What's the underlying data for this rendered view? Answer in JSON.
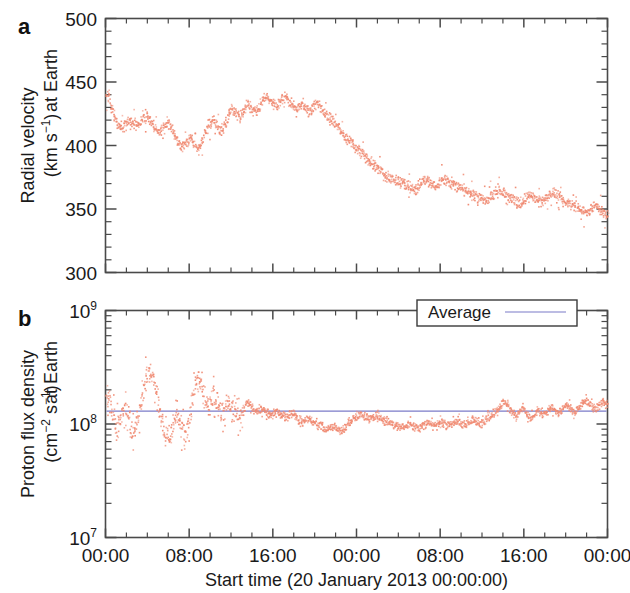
{
  "figure": {
    "panels": [
      {
        "letter": "a",
        "ylabel_line1": "Radial velocity",
        "ylabel_line2_pre": "(km s",
        "ylabel_line2_sup": "−1",
        "ylabel_line2_post": ")",
        "ylabel_suffix": "at Earth"
      },
      {
        "letter": "b",
        "ylabel_line1": "Proton flux density",
        "ylabel_line2_pre": "(cm",
        "ylabel_line2_sup1": "−2",
        "ylabel_line2_mid": " s",
        "ylabel_line2_sup2": "−1",
        "ylabel_line2_post": ")",
        "ylabel_suffix": "at Earth"
      }
    ],
    "legend": {
      "label": "Average",
      "line_color": "#7b7bc8"
    },
    "xaxis": {
      "title": "Start time (20 January 2013 00:00:00)",
      "ticklabels": [
        "00:00",
        "08:00",
        "16:00",
        "00:00",
        "08:00",
        "16:00",
        "00:00"
      ],
      "tick_hours": [
        0,
        8,
        16,
        24,
        32,
        40,
        48
      ],
      "range_hours": [
        0,
        48
      ]
    },
    "series_color": "#f08a72",
    "axis_color": "#4a4a4a"
  },
  "chart_data": [
    {
      "type": "scatter",
      "panel": "a",
      "title": "",
      "xlabel": "Start time (20 January 2013 00:00:00)",
      "ylabel": "Radial velocity at Earth (km s−1)",
      "xlim": [
        0,
        48
      ],
      "ylim": [
        300,
        500
      ],
      "yticks": [
        300,
        350,
        400,
        450,
        500
      ],
      "xticks": [
        0,
        8,
        16,
        24,
        32,
        40,
        48
      ],
      "xticklabels": [
        "00:00",
        "08:00",
        "16:00",
        "00:00",
        "08:00",
        "16:00",
        "00:00"
      ],
      "yscale": "linear",
      "grid": false,
      "marker_color": "#f08a72",
      "x": [
        0.0,
        0.25,
        0.5,
        0.75,
        1.0,
        1.25,
        1.5,
        1.75,
        2.0,
        2.25,
        2.5,
        2.75,
        3.0,
        3.25,
        3.5,
        3.75,
        4.0,
        4.25,
        4.5,
        4.75,
        5.0,
        5.25,
        5.5,
        5.75,
        6.0,
        6.25,
        6.5,
        6.75,
        7.0,
        7.25,
        7.5,
        7.75,
        8.0,
        8.25,
        8.5,
        8.75,
        9.0,
        9.25,
        9.5,
        9.75,
        10.0,
        10.25,
        10.5,
        10.75,
        11.0,
        11.25,
        11.5,
        11.75,
        12.0,
        12.25,
        12.5,
        12.75,
        13.0,
        13.25,
        13.5,
        13.75,
        14.0,
        14.25,
        14.5,
        14.75,
        15.0,
        15.25,
        15.5,
        15.75,
        16.0,
        16.25,
        16.5,
        16.75,
        17.0,
        17.25,
        17.5,
        17.75,
        18.0,
        18.25,
        18.5,
        18.75,
        19.0,
        19.25,
        19.5,
        19.75,
        20.0,
        20.25,
        20.5,
        20.75,
        21.0,
        21.25,
        21.5,
        21.75,
        22.0,
        22.25,
        22.5,
        22.75,
        23.0,
        23.25,
        23.5,
        23.75,
        24.0,
        24.25,
        24.5,
        24.75,
        25.0,
        25.25,
        25.5,
        25.75,
        26.0,
        26.25,
        26.5,
        26.75,
        27.0,
        27.25,
        27.5,
        27.75,
        28.0,
        28.25,
        28.5,
        28.75,
        29.0,
        29.25,
        29.5,
        29.75,
        30.0,
        30.25,
        30.5,
        30.75,
        31.0,
        31.25,
        31.5,
        31.75,
        32.0,
        32.25,
        32.5,
        32.75,
        33.0,
        33.25,
        33.5,
        33.75,
        34.0,
        34.25,
        34.5,
        34.75,
        35.0,
        35.25,
        35.5,
        35.75,
        36.0,
        36.25,
        36.5,
        36.75,
        37.0,
        37.25,
        37.5,
        37.75,
        38.0,
        38.25,
        38.5,
        38.75,
        39.0,
        39.25,
        39.5,
        39.75,
        40.0,
        40.25,
        40.5,
        40.75,
        41.0,
        41.25,
        41.5,
        41.75,
        42.0,
        42.25,
        42.5,
        42.75,
        43.0,
        43.25,
        43.5,
        43.75,
        44.0,
        44.25,
        44.5,
        44.75,
        45.0,
        45.25,
        45.5,
        45.75,
        46.0,
        46.25,
        46.5,
        46.75,
        47.0,
        47.25,
        47.5,
        47.75,
        48.0
      ],
      "y": [
        443,
        438,
        430,
        424,
        419,
        416,
        414,
        416,
        419,
        421,
        420,
        418,
        417,
        419,
        422,
        424,
        423,
        420,
        417,
        414,
        412,
        413,
        416,
        419,
        418,
        414,
        409,
        404,
        401,
        399,
        400,
        403,
        406,
        404,
        400,
        398,
        401,
        406,
        411,
        416,
        419,
        421,
        418,
        414,
        412,
        415,
        420,
        426,
        429,
        427,
        424,
        423,
        426,
        430,
        433,
        431,
        428,
        427,
        429,
        433,
        437,
        439,
        438,
        436,
        434,
        433,
        434,
        437,
        439,
        438,
        435,
        432,
        430,
        429,
        430,
        432,
        431,
        428,
        426,
        429,
        433,
        434,
        431,
        427,
        424,
        422,
        421,
        419,
        417,
        414,
        411,
        408,
        406,
        404,
        402,
        400,
        398,
        396,
        394,
        392,
        390,
        388,
        386,
        384,
        382,
        380,
        378,
        377,
        376,
        375,
        374,
        373,
        372,
        371,
        370,
        369,
        368,
        367,
        366,
        367,
        369,
        372,
        374,
        373,
        371,
        369,
        368,
        370,
        373,
        375,
        374,
        372,
        370,
        369,
        368,
        367,
        366,
        365,
        364,
        363,
        362,
        361,
        360,
        359,
        358,
        357,
        358,
        360,
        362,
        364,
        366,
        365,
        363,
        361,
        359,
        358,
        357,
        356,
        355,
        356,
        358,
        360,
        361,
        360,
        358,
        357,
        356,
        357,
        359,
        361,
        363,
        364,
        363,
        361,
        359,
        357,
        356,
        355,
        354,
        353,
        352,
        351,
        350,
        349,
        348,
        349,
        351,
        353,
        352,
        350,
        348,
        347,
        346,
        345,
        344,
        343,
        342,
        341,
        340,
        339,
        340,
        341,
        340,
        339
      ]
    },
    {
      "type": "scatter",
      "panel": "b",
      "title": "",
      "xlabel": "Start time (20 January 2013 00:00:00)",
      "ylabel": "Proton flux density at Earth (cm−2 s−1)",
      "xlim": [
        0,
        48
      ],
      "ylim": [
        10000000,
        1000000000
      ],
      "yticks": [
        10000000,
        100000000,
        1000000000
      ],
      "yticklabels": [
        "10^7",
        "10^8",
        "10^9"
      ],
      "xticks": [
        0,
        8,
        16,
        24,
        32,
        40,
        48
      ],
      "xticklabels": [
        "00:00",
        "08:00",
        "16:00",
        "00:00",
        "08:00",
        "16:00",
        "00:00"
      ],
      "yscale": "log",
      "grid": false,
      "marker_color": "#f08a72",
      "average_value": 130000000,
      "average_color": "#7b7bc8",
      "x": [
        0.0,
        0.25,
        0.5,
        0.75,
        1.0,
        1.25,
        1.5,
        1.75,
        2.0,
        2.25,
        2.5,
        2.75,
        3.0,
        3.25,
        3.5,
        3.75,
        4.0,
        4.25,
        4.5,
        4.75,
        5.0,
        5.25,
        5.5,
        5.75,
        6.0,
        6.25,
        6.5,
        6.75,
        7.0,
        7.25,
        7.5,
        7.75,
        8.0,
        8.25,
        8.5,
        8.75,
        9.0,
        9.25,
        9.5,
        9.75,
        10.0,
        10.25,
        10.5,
        10.75,
        11.0,
        11.25,
        11.5,
        11.75,
        12.0,
        12.25,
        12.5,
        12.75,
        13.0,
        13.25,
        13.5,
        13.75,
        14.0,
        14.25,
        14.5,
        14.75,
        15.0,
        15.25,
        15.5,
        15.75,
        16.0,
        16.25,
        16.5,
        16.75,
        17.0,
        17.25,
        17.5,
        17.75,
        18.0,
        18.25,
        18.5,
        18.75,
        19.0,
        19.25,
        19.5,
        19.75,
        20.0,
        20.25,
        20.5,
        20.75,
        21.0,
        21.25,
        21.5,
        21.75,
        22.0,
        22.25,
        22.5,
        22.75,
        23.0,
        23.25,
        23.5,
        23.75,
        24.0,
        24.25,
        24.5,
        24.75,
        25.0,
        25.25,
        25.5,
        25.75,
        26.0,
        26.25,
        26.5,
        26.75,
        27.0,
        27.25,
        27.5,
        27.75,
        28.0,
        28.25,
        28.5,
        28.75,
        29.0,
        29.25,
        29.5,
        29.75,
        30.0,
        30.25,
        30.5,
        30.75,
        31.0,
        31.25,
        31.5,
        31.75,
        32.0,
        32.25,
        32.5,
        32.75,
        33.0,
        33.25,
        33.5,
        33.75,
        34.0,
        34.25,
        34.5,
        34.75,
        35.0,
        35.25,
        35.5,
        35.75,
        36.0,
        36.25,
        36.5,
        36.75,
        37.0,
        37.25,
        37.5,
        37.75,
        38.0,
        38.25,
        38.5,
        38.75,
        39.0,
        39.25,
        39.5,
        39.75,
        40.0,
        40.25,
        40.5,
        40.75,
        41.0,
        41.25,
        41.5,
        41.75,
        42.0,
        42.25,
        42.5,
        42.75,
        43.0,
        43.25,
        43.5,
        43.75,
        44.0,
        44.25,
        44.5,
        44.75,
        45.0,
        45.25,
        45.5,
        45.75,
        46.0,
        46.25,
        46.5,
        46.75,
        47.0,
        47.25,
        47.5,
        47.75,
        48.0
      ],
      "y": [
        200000000.0,
        170000000.0,
        140000000.0,
        110000000.0,
        95000000.0,
        100000000.0,
        120000000.0,
        150000000.0,
        130000000.0,
        100000000.0,
        85000000.0,
        90000000.0,
        110000000.0,
        140000000.0,
        180000000.0,
        240000000.0,
        290000000.0,
        310000000.0,
        260000000.0,
        200000000.0,
        150000000.0,
        110000000.0,
        90000000.0,
        80000000.0,
        75000000.0,
        85000000.0,
        100000000.0,
        130000000.0,
        110000000.0,
        90000000.0,
        80000000.0,
        95000000.0,
        120000000.0,
        160000000.0,
        220000000.0,
        260000000.0,
        230000000.0,
        190000000.0,
        160000000.0,
        140000000.0,
        160000000.0,
        190000000.0,
        170000000.0,
        150000000.0,
        130000000.0,
        120000000.0,
        140000000.0,
        160000000.0,
        150000000.0,
        130000000.0,
        120000000.0,
        110000000.0,
        120000000.0,
        140000000.0,
        160000000.0,
        150000000.0,
        140000000.0,
        130000000.0,
        135000000.0,
        140000000.0,
        135000000.0,
        130000000.0,
        125000000.0,
        120000000.0,
        125000000.0,
        130000000.0,
        128000000.0,
        122000000.0,
        118000000.0,
        115000000.0,
        120000000.0,
        125000000.0,
        122000000.0,
        115000000.0,
        110000000.0,
        105000000.0,
        110000000.0,
        115000000.0,
        112000000.0,
        108000000.0,
        105000000.0,
        100000000.0,
        98000000.0,
        95000000.0,
        92000000.0,
        90000000.0,
        93000000.0,
        96000000.0,
        94000000.0,
        91000000.0,
        89000000.0,
        92000000.0,
        98000000.0,
        105000000.0,
        110000000.0,
        115000000.0,
        120000000.0,
        125000000.0,
        122000000.0,
        118000000.0,
        115000000.0,
        112000000.0,
        115000000.0,
        120000000.0,
        118000000.0,
        114000000.0,
        110000000.0,
        108000000.0,
        105000000.0,
        102000000.0,
        100000000.0,
        98000000.0,
        96000000.0,
        94000000.0,
        96000000.0,
        99000000.0,
        102000000.0,
        100000000.0,
        97000000.0,
        95000000.0,
        93000000.0,
        96000000.0,
        100000000.0,
        103000000.0,
        100000000.0,
        97000000.0,
        99000000.0,
        102000000.0,
        105000000.0,
        103000000.0,
        100000000.0,
        98000000.0,
        100000000.0,
        104000000.0,
        108000000.0,
        105000000.0,
        102000000.0,
        100000000.0,
        103000000.0,
        107000000.0,
        110000000.0,
        108000000.0,
        105000000.0,
        102000000.0,
        105000000.0,
        110000000.0,
        115000000.0,
        120000000.0,
        125000000.0,
        130000000.0,
        135000000.0,
        145000000.0,
        160000000.0,
        150000000.0,
        140000000.0,
        132000000.0,
        125000000.0,
        120000000.0,
        130000000.0,
        145000000.0,
        135000000.0,
        120000000.0,
        110000000.0,
        115000000.0,
        125000000.0,
        135000000.0,
        130000000.0,
        125000000.0,
        130000000.0,
        138000000.0,
        145000000.0,
        140000000.0,
        132000000.0,
        126000000.0,
        130000000.0,
        140000000.0,
        150000000.0,
        145000000.0,
        135000000.0,
        130000000.0,
        135000000.0,
        145000000.0,
        155000000.0,
        165000000.0,
        160000000.0,
        150000000.0,
        142000000.0,
        138000000.0,
        145000000.0,
        155000000.0,
        160000000.0,
        155000000.0,
        150000000.0,
        148000000.0,
        150000000.0
      ]
    }
  ]
}
